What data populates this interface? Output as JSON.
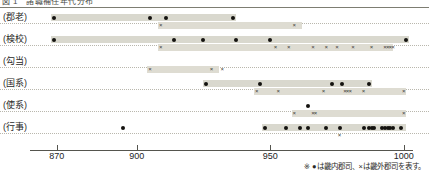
{
  "figure": {
    "title_clipped": "図 1　諸職補任年代分布",
    "footnote": "※ ●は畿内郡司、×は畿外郡司を表す。",
    "legend": [
      {
        "symbol": "●",
        "label": "畿内郡司"
      },
      {
        "symbol": "×",
        "label": "畿外郡司"
      }
    ],
    "colors": {
      "band": "#d9d8ce",
      "dot": "#14120f",
      "cross": "#3a3a35",
      "axis": "#55554e",
      "separator": "#b9b7ad"
    }
  },
  "axis": {
    "label": "",
    "min": 860,
    "max": 1005,
    "ticks": [
      870,
      900,
      950,
      1000
    ],
    "tick_labels": [
      "870",
      "900",
      "950",
      "1000"
    ]
  },
  "categories": [
    {
      "id": "gunro",
      "label": "(郡老)"
    },
    {
      "id": "kengyo",
      "label": "(検校)"
    },
    {
      "id": "koto",
      "label": "(勾当)"
    },
    {
      "id": "kokukei",
      "label": "(国系)"
    },
    {
      "id": "shikei",
      "label": "(使系)"
    },
    {
      "id": "gyoji",
      "label": "(行事)"
    }
  ],
  "chart_data": {
    "type": "scatter",
    "title": "図 1　諸職補任年代分布",
    "xlabel": "",
    "ylabel": "",
    "xlim": [
      860,
      1005
    ],
    "grid": false,
    "legend_position": "bottom-right",
    "series": [
      {
        "name": "畿内郡司",
        "marker": "dot"
      },
      {
        "name": "畿外郡司",
        "marker": "cross"
      }
    ],
    "rows": [
      {
        "category": "(郡老)",
        "dot_band": [
          868,
          937
        ],
        "cross_band": [
          908,
          962
        ],
        "dots": [
          869,
          905,
          911,
          936
        ],
        "crosses": [
          909,
          959
        ]
      },
      {
        "category": "(検校)",
        "dot_band": [
          868,
          1002
        ],
        "cross_band": [
          908,
          996
        ],
        "dots": [
          869,
          914,
          925,
          937,
          950,
          1001
        ],
        "crosses": [
          909,
          952,
          957,
          966,
          971,
          975,
          981,
          988,
          993,
          994,
          995,
          996
        ]
      },
      {
        "category": "(勾当)",
        "dot_band": null,
        "cross_band": [
          904,
          931
        ],
        "dots": [],
        "crosses": [
          905,
          928,
          932
        ]
      },
      {
        "category": "(国系)",
        "dot_band": [
          925,
          988
        ],
        "cross_band": [
          944,
          1001
        ],
        "dots": [
          926,
          946,
          973,
          977,
          987
        ],
        "crosses": [
          945,
          953,
          970,
          978,
          979,
          980,
          985,
          1000
        ]
      },
      {
        "category": "(使系)",
        "dot_band": null,
        "cross_band": [
          958,
          1001
        ],
        "dots": [
          964
        ],
        "crosses": [
          959,
          966,
          967,
          1000
        ]
      },
      {
        "category": "(行事)",
        "dot_band": [
          947,
          1001
        ],
        "cross_band": null,
        "dots": [
          895,
          948,
          956,
          961,
          964,
          971,
          976,
          985,
          987,
          988,
          989,
          992,
          993,
          994,
          995,
          996,
          999
        ],
        "crosses": [
          976
        ]
      }
    ]
  }
}
